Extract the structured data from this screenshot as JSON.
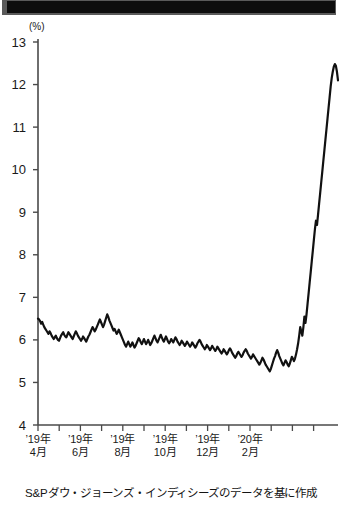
{
  "titlebar": {
    "label": ""
  },
  "chart_data": {
    "type": "line",
    "title": "",
    "subtitle": "",
    "unit_label": "(%)",
    "xlabel": "",
    "ylabel": "",
    "ylim": [
      4,
      13
    ],
    "y_ticks": [
      "13",
      "12",
      "11",
      "10",
      "9",
      "8",
      "7",
      "6",
      "5",
      "4"
    ],
    "y_tick_values": [
      13,
      12,
      11,
      10,
      9,
      8,
      7,
      6,
      5,
      4
    ],
    "grid": false,
    "legend": "none",
    "x_tick_labels": [
      {
        "line1": "’19年",
        "line2": "4月"
      },
      {
        "line1": "’19年",
        "line2": "6月"
      },
      {
        "line1": "’19年",
        "line2": "8月"
      },
      {
        "line1": "’19年",
        "line2": "10月"
      },
      {
        "line1": "’19年",
        "line2": "12月"
      },
      {
        "line1": "’20年",
        "line2": "2月"
      }
    ],
    "x_minor_tick_count": 14,
    "line_color": "#111111",
    "series": [
      {
        "name": "利回り",
        "x": [
          0,
          1,
          2,
          3,
          4,
          5,
          6,
          7,
          8,
          9,
          10,
          11,
          12,
          13,
          14,
          15,
          16,
          17,
          18,
          19,
          20,
          21,
          22,
          23,
          24,
          25,
          26,
          27,
          28,
          29,
          30,
          31,
          32,
          33,
          34,
          35,
          36,
          37,
          38,
          39,
          40,
          41,
          42,
          43,
          44,
          45,
          46,
          47,
          48,
          49,
          50,
          51,
          52,
          53,
          54,
          55,
          56,
          57,
          58,
          59,
          60,
          61,
          62,
          63,
          64,
          65,
          66,
          67,
          68,
          69,
          70,
          71,
          72,
          73,
          74,
          75,
          76,
          77,
          78,
          79,
          80,
          81,
          82,
          83,
          84,
          85,
          86,
          87,
          88,
          89,
          90,
          91,
          92,
          93,
          94,
          95,
          96,
          97,
          98,
          99,
          100,
          101,
          102,
          103,
          104,
          105,
          106,
          107,
          108,
          109,
          110,
          111,
          112,
          113,
          114,
          115,
          116,
          117,
          118,
          119,
          120,
          121,
          122,
          123,
          124,
          125,
          126,
          127,
          128,
          129,
          130,
          131,
          132,
          133,
          134,
          135,
          136,
          137,
          138,
          139,
          140,
          141,
          142,
          143,
          144,
          145,
          146,
          147,
          148,
          149,
          150,
          151,
          152,
          153,
          154,
          155,
          156,
          157,
          158,
          159,
          160,
          161,
          162,
          163,
          164,
          165,
          166,
          167,
          168,
          169,
          170,
          171,
          172,
          173,
          174,
          175,
          176,
          177,
          178,
          179,
          180,
          181,
          182,
          183,
          184,
          185,
          186,
          187,
          188,
          189,
          190,
          191,
          192,
          193,
          194,
          195,
          196,
          197,
          198,
          199,
          200,
          201,
          202,
          203,
          204,
          205,
          206,
          207,
          208,
          209,
          210,
          211,
          212,
          213,
          214,
          215,
          216,
          217,
          218,
          219,
          220,
          221,
          222,
          223,
          224,
          225,
          226,
          227,
          228,
          229,
          230,
          231,
          232,
          233,
          234,
          235,
          236,
          237,
          238,
          239,
          240,
          241,
          242,
          243,
          244,
          245,
          246,
          247,
          248,
          249,
          250,
          251,
          252,
          253,
          254,
          255,
          256,
          257,
          258,
          259,
          260,
          261,
          262,
          263,
          264,
          265,
          266,
          267,
          268,
          269,
          270,
          271,
          272,
          273,
          274,
          275,
          276,
          277,
          278,
          279,
          280,
          281,
          282,
          283,
          284,
          285,
          286
        ],
        "values": [
          6.5,
          6.48,
          6.44,
          6.38,
          6.42,
          6.36,
          6.3,
          6.26,
          6.22,
          6.18,
          6.14,
          6.2,
          6.16,
          6.1,
          6.06,
          6.02,
          6.06,
          6.1,
          6.04,
          6.0,
          5.98,
          6.04,
          6.1,
          6.14,
          6.18,
          6.12,
          6.08,
          6.06,
          6.12,
          6.18,
          6.14,
          6.1,
          6.06,
          6.02,
          6.08,
          6.14,
          6.2,
          6.16,
          6.1,
          6.06,
          6.02,
          5.98,
          6.02,
          6.08,
          6.04,
          6.0,
          5.96,
          6.02,
          6.08,
          6.12,
          6.18,
          6.24,
          6.3,
          6.26,
          6.2,
          6.24,
          6.3,
          6.36,
          6.42,
          6.48,
          6.42,
          6.36,
          6.3,
          6.36,
          6.44,
          6.52,
          6.6,
          6.54,
          6.46,
          6.4,
          6.34,
          6.28,
          6.22,
          6.26,
          6.2,
          6.14,
          6.18,
          6.24,
          6.18,
          6.12,
          6.06,
          6.0,
          5.94,
          5.88,
          5.84,
          5.9,
          5.96,
          5.9,
          5.84,
          5.88,
          5.94,
          5.88,
          5.82,
          5.86,
          5.92,
          5.98,
          6.04,
          6.0,
          5.94,
          5.9,
          5.96,
          6.02,
          5.96,
          5.9,
          5.94,
          6.0,
          5.94,
          5.88,
          5.92,
          5.98,
          6.04,
          6.1,
          6.04,
          5.98,
          5.94,
          6.0,
          6.06,
          6.12,
          6.06,
          6.0,
          5.96,
          6.02,
          6.08,
          6.02,
          5.96,
          5.92,
          5.96,
          6.02,
          5.98,
          5.94,
          6.0,
          6.06,
          6.02,
          5.96,
          5.92,
          5.88,
          5.92,
          5.98,
          5.94,
          5.9,
          5.86,
          5.9,
          5.96,
          5.92,
          5.88,
          5.84,
          5.88,
          5.94,
          5.9,
          5.86,
          5.82,
          5.86,
          5.92,
          5.96,
          6.0,
          5.96,
          5.9,
          5.86,
          5.82,
          5.78,
          5.82,
          5.88,
          5.84,
          5.8,
          5.76,
          5.8,
          5.86,
          5.82,
          5.78,
          5.74,
          5.78,
          5.84,
          5.8,
          5.76,
          5.72,
          5.68,
          5.72,
          5.78,
          5.74,
          5.7,
          5.66,
          5.7,
          5.76,
          5.8,
          5.76,
          5.7,
          5.66,
          5.62,
          5.58,
          5.62,
          5.68,
          5.72,
          5.68,
          5.64,
          5.6,
          5.64,
          5.7,
          5.74,
          5.78,
          5.74,
          5.68,
          5.64,
          5.6,
          5.56,
          5.6,
          5.66,
          5.62,
          5.58,
          5.54,
          5.5,
          5.46,
          5.42,
          5.46,
          5.52,
          5.58,
          5.54,
          5.48,
          5.42,
          5.38,
          5.34,
          5.3,
          5.26,
          5.32,
          5.4,
          5.48,
          5.56,
          5.62,
          5.7,
          5.76,
          5.7,
          5.62,
          5.56,
          5.5,
          5.44,
          5.4,
          5.46,
          5.52,
          5.48,
          5.42,
          5.38,
          5.44,
          5.52,
          5.6,
          5.56,
          5.5,
          5.56,
          5.66,
          5.78,
          5.92,
          6.1,
          6.3,
          6.2,
          6.1,
          6.3,
          6.55,
          6.4,
          6.6,
          6.85,
          7.1,
          7.35,
          7.6,
          7.85,
          8.1,
          8.35,
          8.6,
          8.8,
          8.7,
          8.95,
          9.2,
          9.45,
          9.7,
          9.95,
          10.2,
          10.45,
          10.7,
          10.95,
          11.2,
          11.45,
          11.7,
          11.95,
          12.15,
          12.3,
          12.42,
          12.48,
          12.44,
          12.3,
          12.1
        ]
      }
    ],
    "caption": "S&Pダウ・ジョーンズ・インディシーズのデータを基に作成"
  }
}
